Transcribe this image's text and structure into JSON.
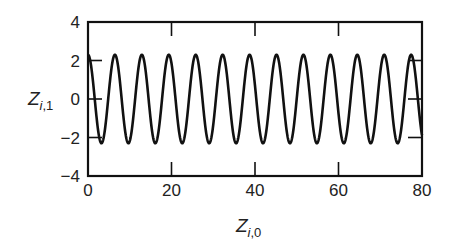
{
  "chart_data": {
    "type": "line",
    "title": "",
    "xlabel": "Z_{i,0}",
    "ylabel": "Z_{i,1}",
    "xlabel_parts": {
      "base": "Z",
      "sub_italic": "i",
      "sub_plain": ",0"
    },
    "ylabel_parts": {
      "base": "Z",
      "sub_italic": "i",
      "sub_plain": ",1"
    },
    "xlim": [
      0,
      80
    ],
    "ylim": [
      -4,
      4
    ],
    "xticks": [
      0,
      20,
      40,
      60,
      80
    ],
    "yticks": [
      -4,
      -2,
      0,
      2,
      4
    ],
    "xtick_labels": [
      "0",
      "20",
      "40",
      "60",
      "80"
    ],
    "ytick_labels": [
      "−4",
      "−2",
      "0",
      "2",
      "4"
    ],
    "grid": false,
    "legend": null,
    "series": [
      {
        "name": "Z_i,1 vs Z_i,0",
        "description": "cosine-like oscillation",
        "function": "y = A*cos(2*pi*x/P)",
        "amplitude": 2.3,
        "period": 6.45,
        "phase": 0,
        "x_start": 0,
        "x_end": 80,
        "peaks_count": 13,
        "color": "#111111"
      }
    ]
  }
}
